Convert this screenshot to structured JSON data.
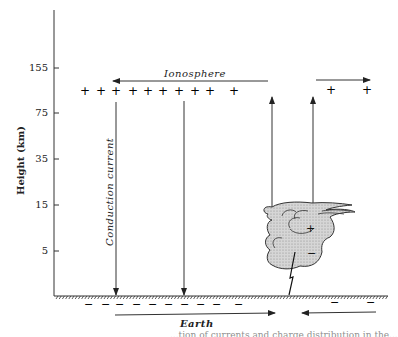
{
  "diagram": {
    "y_axis": {
      "title": "Height (km)",
      "ticks": [
        "155",
        "75",
        "35",
        "15",
        "5"
      ]
    },
    "labels": {
      "ionosphere": "Ionosphere",
      "earth": "Earth",
      "conduction_current": "Conduction current",
      "cloud_plus": "+",
      "cloud_minus": "−"
    },
    "ionosphere_charges": [
      "+",
      "+",
      "+",
      "+",
      "+",
      "+",
      "+",
      "+",
      "+",
      "+",
      "+",
      "+"
    ],
    "earth_charges": [
      "−",
      "−",
      "−",
      "−",
      "−",
      "−",
      "−",
      "−",
      "−",
      "−",
      "−",
      "−"
    ],
    "caption_fragment": "...tion of currents and charge distribution in the..."
  }
}
